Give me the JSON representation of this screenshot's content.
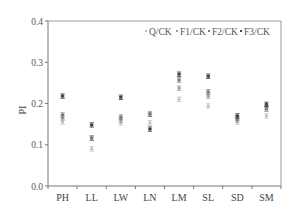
{
  "chart_data": {
    "type": "scatter",
    "title": "",
    "xlabel": "",
    "ylabel": "PI",
    "ylim": [
      0.0,
      0.4
    ],
    "yticks": [
      "0.0",
      "0.1",
      "0.2",
      "0.3",
      "0.4"
    ],
    "grid": false,
    "legend_position": "top-right inside",
    "categories": [
      "PH",
      "LL",
      "LW",
      "LN",
      "LM",
      "SL",
      "SD",
      "SM"
    ],
    "series": [
      {
        "name": "Q/CK",
        "values": [
          0.155,
          0.09,
          0.153,
          0.153,
          0.21,
          0.194,
          0.155,
          0.17
        ]
      },
      {
        "name": "F1/CK",
        "values": [
          0.165,
          0.116,
          0.16,
          0.174,
          0.237,
          0.218,
          0.16,
          0.186
        ]
      },
      {
        "name": "F2/CK",
        "values": [
          0.172,
          0.116,
          0.167,
          0.174,
          0.257,
          0.228,
          0.165,
          0.19
        ]
      },
      {
        "name": "F3/CK",
        "values": [
          0.218,
          0.148,
          0.215,
          0.138,
          0.271,
          0.266,
          0.17,
          0.198
        ]
      }
    ],
    "error_bars": true
  },
  "legend": {
    "items": [
      "Q/CK",
      "F1/CK",
      "F2/CK",
      "F3/CK"
    ]
  }
}
